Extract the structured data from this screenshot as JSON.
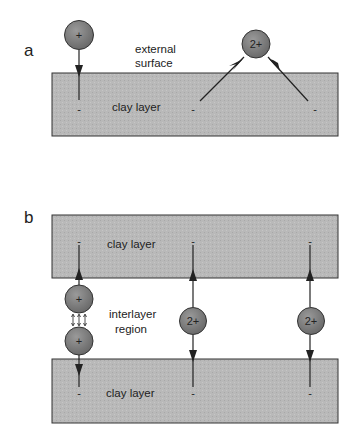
{
  "panel_a": {
    "label": "a",
    "surface_label_line1": "external",
    "surface_label_line2": "surface",
    "layer_label": "clay layer",
    "cation_mono": "+",
    "cation_di": "2+",
    "charges": [
      "-",
      "-",
      "-"
    ]
  },
  "panel_b": {
    "label": "b",
    "top_layer_label": "clay layer",
    "bottom_layer_label": "clay layer",
    "region_label_line1": "interlayer",
    "region_label_line2": "region",
    "cation_mono": "+",
    "cation_di": "2+",
    "charges": [
      "-",
      "-",
      "-",
      "-",
      "-",
      "-"
    ]
  },
  "colors": {
    "layer_fill": "#b8b8b8",
    "cation_fill": "#7d7d7d",
    "stroke": "#222222"
  }
}
